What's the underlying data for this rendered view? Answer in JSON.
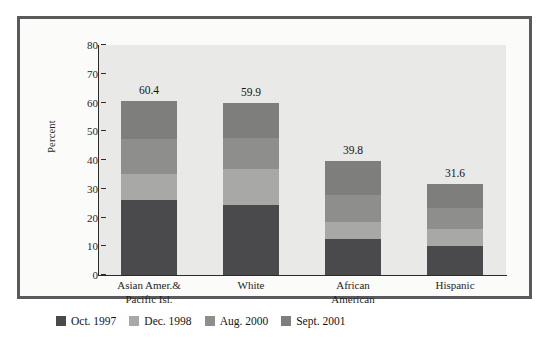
{
  "chart_data": {
    "type": "bar",
    "subtype": "stacked-bar",
    "title": "",
    "xlabel": "",
    "ylabel": "Percent",
    "ylim": [
      0,
      80
    ],
    "yticks": [
      0,
      10,
      20,
      30,
      40,
      50,
      60,
      70,
      80
    ],
    "ytick_labels": [
      "0",
      "10",
      "20",
      "30",
      "40",
      "50",
      "60",
      "70",
      "80"
    ],
    "grid": false,
    "legend_position": "below-figure",
    "categories": [
      "Asian Amer.&\nPacific Isl.",
      "White",
      "African\nAmerican",
      "Hispanic"
    ],
    "category_lines": [
      [
        "Asian Amer.&",
        "Pacific Isl."
      ],
      [
        "White",
        ""
      ],
      [
        "African",
        "American"
      ],
      [
        "Hispanic",
        ""
      ]
    ],
    "series": [
      {
        "name": "Oct. 1997",
        "color": "#4a4a4c",
        "values": [
          26.0,
          24.5,
          12.4,
          10.0
        ]
      },
      {
        "name": "Dec. 1998",
        "color": "#a8a8a6",
        "values": [
          9.2,
          12.5,
          6.1,
          6.1
        ]
      },
      {
        "name": "Aug. 2000",
        "color": "#8e8e8c",
        "values": [
          12.0,
          10.6,
          9.5,
          7.2
        ]
      },
      {
        "name": "Sept. 2001",
        "color": "#7e7e7c",
        "values": [
          13.2,
          12.3,
          11.8,
          8.3
        ]
      }
    ],
    "totals": [
      60.4,
      59.9,
      39.8,
      31.6
    ],
    "total_labels": [
      "60.4",
      "59.9",
      "39.8",
      "31.6"
    ]
  },
  "legend": {
    "items": [
      {
        "label": "Oct. 1997",
        "color": "#4a4a4c"
      },
      {
        "label": "Dec. 1998",
        "color": "#a8a8a6"
      },
      {
        "label": "Aug. 2000",
        "color": "#8e8e8c"
      },
      {
        "label": "Sept. 2001",
        "color": "#7e7e7c"
      }
    ]
  },
  "colors": {
    "frame_border": "#5a5a5c",
    "plot_background": "#e9e9e7",
    "figure_background": "#fbfbfa",
    "axis": "#2b2b2b",
    "text": "#1f1f1f"
  }
}
